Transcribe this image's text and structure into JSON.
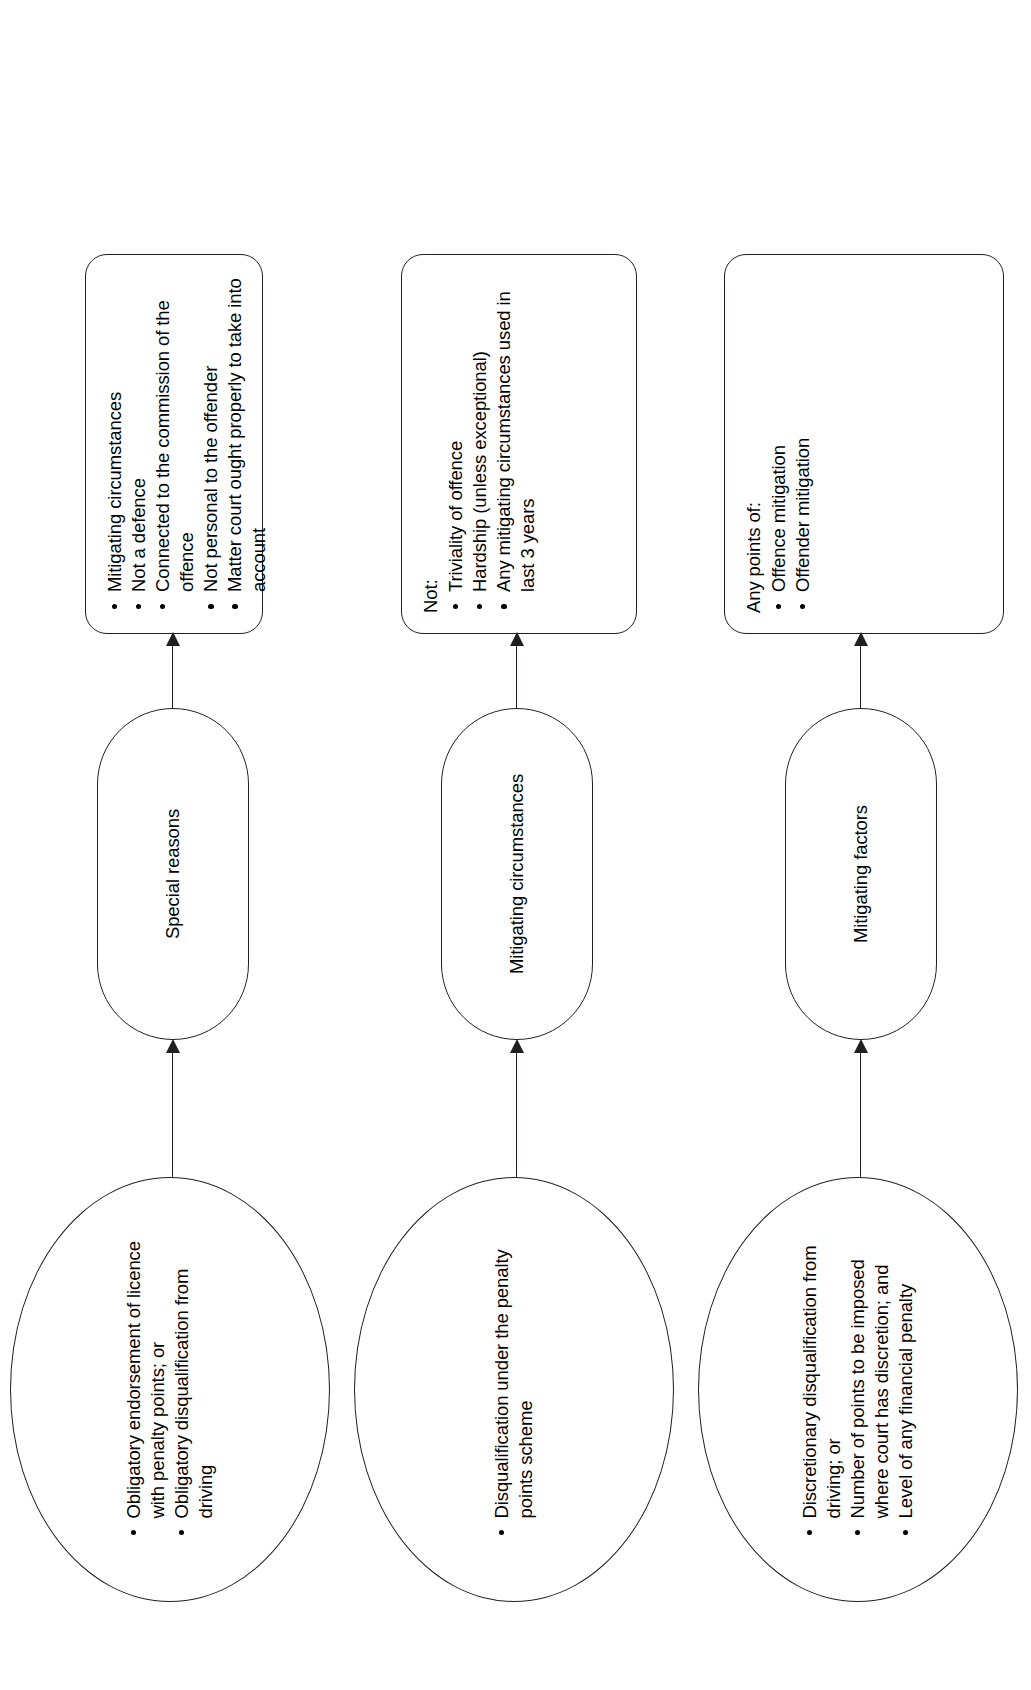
{
  "diagram": {
    "orientation": "rotated-90-ccw",
    "line_color": "#231f20",
    "background": "#ffffff",
    "flows": [
      {
        "id": "flow-special-reasons",
        "start": {
          "shape": "ellipse",
          "heading": "",
          "bullets": [
            "Obligatory endorsement of licence with penalty points; or",
            "Obligatory disqualification from driving"
          ]
        },
        "middle": {
          "shape": "pill",
          "label": "Special reasons"
        },
        "end": {
          "shape": "rounded-rect",
          "heading": "",
          "bullets": [
            "Mitigating circumstances",
            "Not a defence",
            "Connected to the commission of the offence",
            "Not personal to the offender",
            "Matter court ought properly to take into account"
          ]
        }
      },
      {
        "id": "flow-mitigating-circumstances",
        "start": {
          "shape": "ellipse",
          "heading": "",
          "bullets": [
            "Disqualification under the penalty points scheme"
          ]
        },
        "middle": {
          "shape": "pill",
          "label": "Mitigating circumstances"
        },
        "end": {
          "shape": "rounded-rect",
          "heading": "Not:",
          "bullets": [
            "Triviality of offence",
            "Hardship (unless exceptional)",
            "Any mitigating circumstances used in last 3 years"
          ]
        }
      },
      {
        "id": "flow-mitigating-factors",
        "start": {
          "shape": "ellipse",
          "heading": "",
          "bullets": [
            "Discretionary disqualification from driving; or",
            "Number of points to be imposed where court has discretion; and",
            "Level of any financial penalty"
          ]
        },
        "middle": {
          "shape": "pill",
          "label": "Mitigating factors"
        },
        "end": {
          "shape": "rounded-rect",
          "heading": "Any points of:",
          "bullets": [
            "Offence mitigation",
            "Offender mitigation"
          ]
        }
      }
    ]
  }
}
